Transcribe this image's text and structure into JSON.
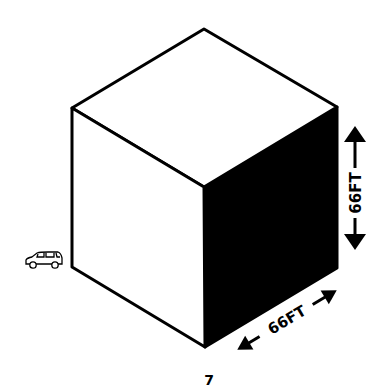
{
  "diagram": {
    "title": "",
    "scale_reference": "car-icon",
    "labels": {
      "height": "66FT",
      "depth": "66FT"
    },
    "page_number": "7",
    "colors": {
      "outline": "#000000",
      "shaded_face": "#000000",
      "background": "#ffffff"
    }
  }
}
